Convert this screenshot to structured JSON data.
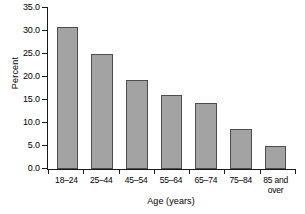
{
  "chart_data": {
    "type": "bar",
    "title": "",
    "xlabel": "Age (years)",
    "ylabel": "Percent",
    "categories": [
      "18–24",
      "25–44",
      "45–54",
      "55–64",
      "65–74",
      "75–84",
      "85 and over"
    ],
    "category_lines": [
      [
        "18–24"
      ],
      [
        "25–44"
      ],
      [
        "45–54"
      ],
      [
        "55–64"
      ],
      [
        "65–74"
      ],
      [
        "75–84"
      ],
      [
        "85 and",
        "over"
      ]
    ],
    "values": [
      30.9,
      25.0,
      19.3,
      16.0,
      14.4,
      8.8,
      5.0
    ],
    "ylim": [
      0.0,
      35.0
    ],
    "ytick_values": [
      0.0,
      5.0,
      10.0,
      15.0,
      20.0,
      25.0,
      30.0,
      35.0
    ],
    "ytick_labels": [
      "0.0",
      "5.0",
      "10.0",
      "15.0",
      "20.0",
      "25.0",
      "30.0",
      "35.0"
    ],
    "grid": false,
    "legend": null,
    "bar_color": "#a3a3a3",
    "bar_edge_color": "#4d4d4d",
    "axis_color": "#1a1a1a",
    "background_color": "#ffffff"
  }
}
